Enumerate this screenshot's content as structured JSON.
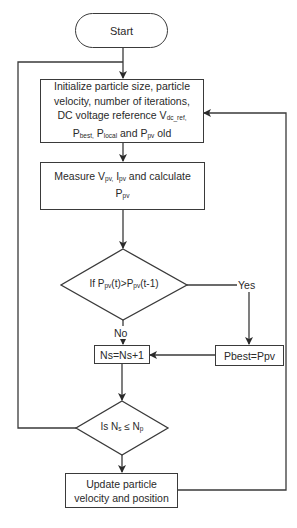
{
  "flowchart": {
    "start": {
      "label": "Start"
    },
    "init": {
      "line1": "Initialize particle size, particle",
      "line2": "velocity, number of iterations,",
      "line3_pre": "DC voltage reference V",
      "line3_sub": "dc_ref,",
      "line4_p1": "P",
      "line4_s1": "best,",
      "line4_p2": " P",
      "line4_s2": "local",
      "line4_mid": " and P",
      "line4_s3": "pv",
      "line4_end": " old"
    },
    "measure": {
      "pre": "Measure V",
      "sub1": "pv,",
      "mid": " I",
      "sub2": "pv",
      "post": " and calculate",
      "line2_p": "P",
      "line2_sub": "pv"
    },
    "decision1": {
      "pre": "If P",
      "sub1": "pv",
      "mid": "(t)>P",
      "sub2": "pv",
      "post": "(t-1)",
      "yes_label": "Yes",
      "no_label": "No"
    },
    "increment": {
      "label": "Ns=Ns+1"
    },
    "pbest": {
      "label": "Pbest=Ppv"
    },
    "decision2": {
      "pre": "Is N",
      "sub1": "s",
      "mid": " ≤ N",
      "sub2": "p"
    },
    "update": {
      "line1": "Update particle",
      "line2": "velocity and position"
    }
  },
  "colors": {
    "stroke": "#3a3a3a",
    "text": "#2a2a2a",
    "background": "#ffffff"
  }
}
